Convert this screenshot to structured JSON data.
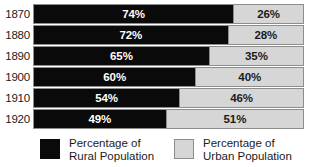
{
  "chart_data": {
    "type": "bar",
    "title": "",
    "subtitle": "",
    "orientation": "horizontal",
    "stacked": true,
    "normalized": true,
    "xlabel": "",
    "ylabel": "",
    "xlim": [
      0,
      100
    ],
    "grid": false,
    "legend_position": "bottom",
    "categories": [
      "1870",
      "1880",
      "1890",
      "1900",
      "1910",
      "1920"
    ],
    "series": [
      {
        "name": "Percentage of Rural Population",
        "color": "#0a0a0a",
        "values": [
          74,
          72,
          65,
          60,
          54,
          49
        ],
        "value_labels": [
          "74%",
          "72%",
          "65%",
          "60%",
          "54%",
          "49%"
        ]
      },
      {
        "name": "Percentage of Urban Population",
        "color": "#d6d6d6",
        "values": [
          26,
          28,
          35,
          40,
          46,
          51
        ],
        "value_labels": [
          "26%",
          "28%",
          "35%",
          "40%",
          "46%",
          "51%"
        ]
      }
    ]
  },
  "title_sliver": {
    "text": ""
  },
  "rows": [
    {
      "year": "1870",
      "rural_pct": 74,
      "urban_pct": 26,
      "rural_label": "74%",
      "urban_label": "26%"
    },
    {
      "year": "1880",
      "rural_pct": 72,
      "urban_pct": 28,
      "rural_label": "72%",
      "urban_label": "28%"
    },
    {
      "year": "1890",
      "rural_pct": 65,
      "urban_pct": 35,
      "rural_label": "65%",
      "urban_label": "35%"
    },
    {
      "year": "1900",
      "rural_pct": 60,
      "urban_pct": 40,
      "rural_label": "60%",
      "urban_label": "40%"
    },
    {
      "year": "1910",
      "rural_pct": 54,
      "urban_pct": 46,
      "rural_label": "54%",
      "urban_label": "46%"
    },
    {
      "year": "1920",
      "rural_pct": 49,
      "urban_pct": 51,
      "rural_label": "49%",
      "urban_label": "51%"
    }
  ],
  "legend": {
    "items": [
      {
        "swatch": "black-filled-square",
        "line1": "Percentage of",
        "line2": "Rural Population",
        "color": "#0a0a0a"
      },
      {
        "swatch": "light-gray-outlined-square",
        "line1": "Percentage of",
        "line2": "Urban Population",
        "color": "#d6d6d6"
      }
    ]
  },
  "colors": {
    "rural": "#0a0a0a",
    "urban": "#d6d6d6",
    "bar_border": "#8d8d8d",
    "text_dark": "#1b1b1b",
    "text_light": "#ffffff",
    "background": "#ffffff"
  }
}
